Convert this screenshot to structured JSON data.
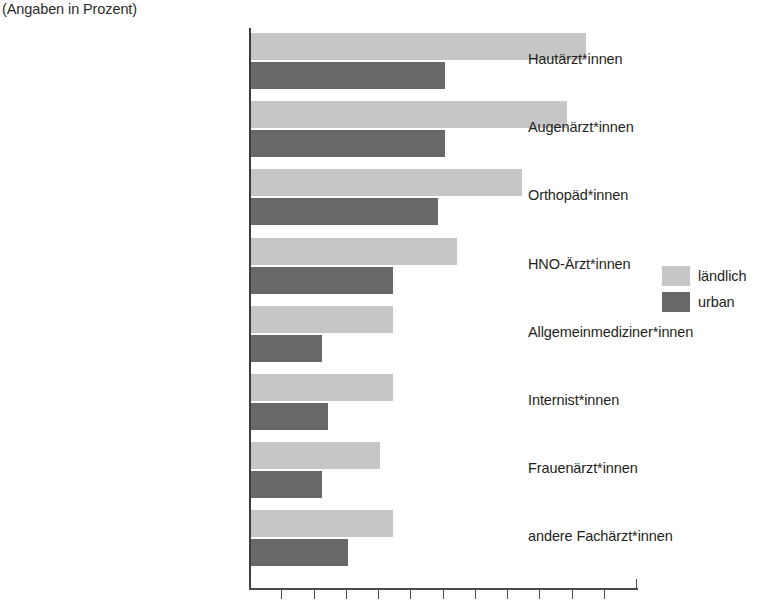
{
  "subtitle": "(Angaben in Prozent)",
  "legend": {
    "position": "right",
    "items": [
      {
        "label": "ländlich",
        "color": "#c6c6c6",
        "key": "rural"
      },
      {
        "label": "urban",
        "color": "#686868",
        "key": "urban"
      }
    ]
  },
  "axis": {
    "tick_count": 13,
    "x_min": 0,
    "x_max": 60,
    "tick_step": 5,
    "tick_labels_visible": false
  },
  "chart_data": {
    "type": "bar",
    "orientation": "horizontal",
    "title": "",
    "subtitle": "(Angaben in Prozent)",
    "xlabel": "",
    "ylabel": "",
    "xlim": [
      0,
      60
    ],
    "grid": false,
    "legend_position": "right",
    "categories": [
      "Hautärzt*innen",
      "Augenärzt*innen",
      "Orthopäd*innen",
      "HNO-Ärzt*innen",
      "Allgemeinmediziner*innen",
      "Internist*innen",
      "Frauenärzt*innen",
      "andere Fachärzt*innen"
    ],
    "series": [
      {
        "name": "ländlich",
        "color": "#c6c6c6",
        "values": [
          52,
          49,
          42,
          32,
          22,
          22,
          20,
          22
        ]
      },
      {
        "name": "urban",
        "color": "#686868",
        "values": [
          30,
          30,
          29,
          22,
          11,
          12,
          11,
          15
        ]
      }
    ]
  }
}
